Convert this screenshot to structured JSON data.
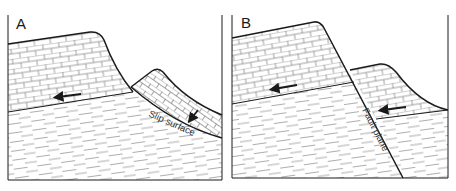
{
  "figure": {
    "type": "geology-cross-section",
    "colors": {
      "line": "#1a1a1a",
      "hatch": "#7a7a7a",
      "background": "#ffffff"
    }
  },
  "panels": [
    {
      "label": "A",
      "annotation": "Slip surface",
      "layers": [
        "limestone (brick pattern)",
        "shale (dashed pattern)"
      ],
      "arrows": [
        "left-pointing arrow in upper limestone",
        "down-slope arrow in slumped block"
      ]
    },
    {
      "label": "B",
      "annotation": "Fault plane",
      "layers": [
        "limestone (brick pattern)",
        "shale (dashed pattern)"
      ],
      "arrows": [
        "left-pointing arrow in left limestone",
        "left-pointing arrow in down-thrown limestone block"
      ]
    }
  ]
}
